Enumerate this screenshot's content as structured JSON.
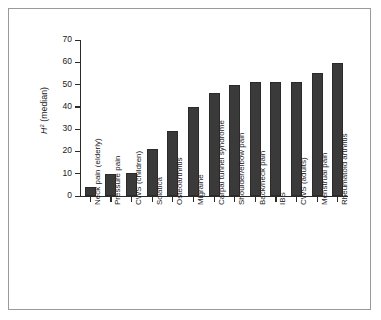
{
  "figure": {
    "border_color": "#9a9a9a",
    "background": "#ffffff",
    "bar_color": "#3a3a3a",
    "axis_color": "#2b2b2b"
  },
  "axis": {
    "y_title_symbol": "H",
    "y_title_superscript": "2",
    "y_title_rest": " (median)",
    "y_ticks": [
      "70",
      "60",
      "50",
      "40",
      "30",
      "20",
      "10",
      "0"
    ]
  },
  "chart_data": {
    "type": "bar",
    "title": "",
    "xlabel": "",
    "ylabel": "H² (median)",
    "ylim": [
      0,
      70
    ],
    "ytick_step": 10,
    "grid": false,
    "legend": "none",
    "orientation": "vertical",
    "categories": [
      "Neck pain (elderly)",
      "Pressure pain",
      "CWS (children)",
      "Sciatica",
      "Osteoarthritis",
      "Migraine",
      "Carpal tunnel syndrome",
      "Shoulder/elbow pain",
      "Back/neck pain",
      "IBS",
      "CWS (adults)",
      "Menstrual pain",
      "Rheumatoid arthritis"
    ],
    "values": [
      4,
      10,
      10.3,
      21,
      29,
      40,
      46,
      50,
      51,
      51,
      51,
      55,
      59.5
    ]
  }
}
